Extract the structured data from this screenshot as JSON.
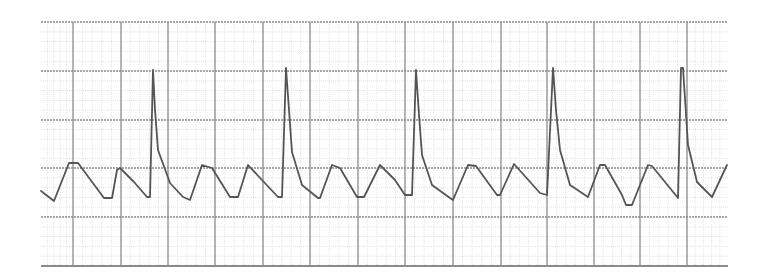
{
  "chart_data": {
    "type": "line",
    "title": "",
    "xlabel": "",
    "ylabel": "",
    "legend": [],
    "grid": {
      "on": true,
      "x_min": 41,
      "x_max": 728,
      "y_min": 22,
      "y_max": 266,
      "major_x_lines": [
        41,
        73,
        121,
        168,
        215,
        263,
        310,
        358,
        405,
        453,
        501,
        547,
        594,
        640,
        687,
        728
      ],
      "major_y_lines": [
        22,
        71,
        120,
        168,
        217,
        266
      ],
      "minor_subdivisions": 5,
      "major_color": "#8a8a8a",
      "minor_color": "#dcdcdc",
      "border_color": "#7a7a7a"
    },
    "series": [
      {
        "name": "ecg-trace",
        "color": "#555555",
        "description": "ECG rhythm strip: repeating T-like waves with 5 tall narrow spikes (R waves)",
        "points": [
          [
            41,
            191
          ],
          [
            54,
            201
          ],
          [
            69,
            163
          ],
          [
            78,
            163
          ],
          [
            104,
            198
          ],
          [
            112,
            198
          ],
          [
            117,
            170
          ],
          [
            120,
            168
          ],
          [
            134,
            182
          ],
          [
            147,
            197
          ],
          [
            150,
            197
          ],
          [
            153,
            70
          ],
          [
            155,
            110
          ],
          [
            158,
            150
          ],
          [
            170,
            183
          ],
          [
            183,
            197
          ],
          [
            190,
            200
          ],
          [
            202,
            165
          ],
          [
            212,
            168
          ],
          [
            230,
            197
          ],
          [
            238,
            197
          ],
          [
            248,
            165
          ],
          [
            262,
            180
          ],
          [
            278,
            197
          ],
          [
            282,
            197
          ],
          [
            286,
            68
          ],
          [
            289,
            110
          ],
          [
            292,
            152
          ],
          [
            302,
            185
          ],
          [
            318,
            198
          ],
          [
            320,
            198
          ],
          [
            332,
            165
          ],
          [
            340,
            168
          ],
          [
            357,
            197
          ],
          [
            364,
            197
          ],
          [
            380,
            165
          ],
          [
            395,
            180
          ],
          [
            405,
            195
          ],
          [
            412,
            195
          ],
          [
            416,
            70
          ],
          [
            419,
            115
          ],
          [
            422,
            155
          ],
          [
            432,
            185
          ],
          [
            450,
            198
          ],
          [
            453,
            200
          ],
          [
            468,
            165
          ],
          [
            476,
            166
          ],
          [
            497,
            195
          ],
          [
            500,
            195
          ],
          [
            514,
            164
          ],
          [
            540,
            193
          ],
          [
            547,
            195
          ],
          [
            553,
            68
          ],
          [
            556,
            110
          ],
          [
            560,
            150
          ],
          [
            570,
            185
          ],
          [
            588,
            197
          ],
          [
            600,
            165
          ],
          [
            605,
            165
          ],
          [
            622,
            195
          ],
          [
            626,
            205
          ],
          [
            632,
            205
          ],
          [
            648,
            165
          ],
          [
            652,
            166
          ],
          [
            678,
            198
          ],
          [
            681,
            68
          ],
          [
            683,
            68
          ],
          [
            688,
            145
          ],
          [
            697,
            182
          ],
          [
            712,
            197
          ],
          [
            727,
            165
          ]
        ]
      }
    ],
    "r_peaks_x": [
      153,
      286,
      416,
      553,
      682
    ]
  }
}
